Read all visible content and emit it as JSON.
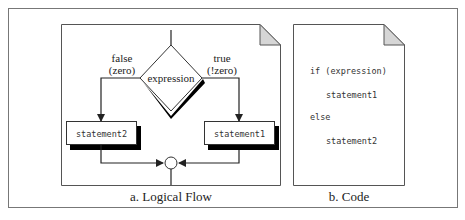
{
  "figure": {
    "logical_flow": {
      "caption": "a. Logical Flow",
      "decision": "expression",
      "false_label_line1": "false",
      "false_label_line2": "(zero)",
      "true_label_line1": "true",
      "true_label_line2": "(!zero)",
      "false_statement": "statement2",
      "true_statement": "statement1"
    },
    "code": {
      "caption": "b. Code",
      "lines": [
        "if (expression)",
        "statement1",
        "else",
        "statement2"
      ]
    },
    "colors": {
      "stroke": "#333333",
      "fold": "#d6d6d6",
      "shadow": "#000000"
    }
  }
}
